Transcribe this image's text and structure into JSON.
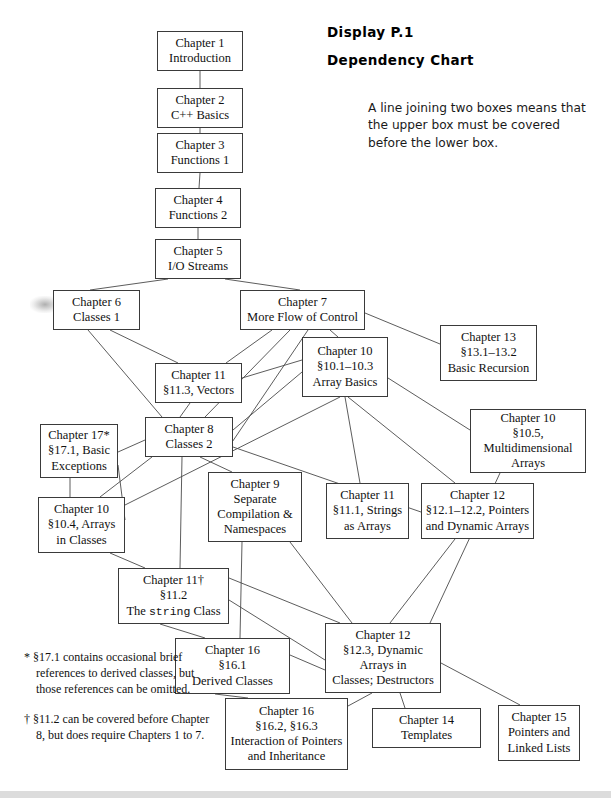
{
  "header": {
    "title_line_1": "Display P.1",
    "title_line_2": "Dependency Chart",
    "legend_note": "A line joining two boxes means that the upper box must be covered before the lower box."
  },
  "footnotes": {
    "star": "* §17.1 contains occasional brief references to derived classes, but those references can be omitted.",
    "dagger": "† §11.2 can be covered before Chapter 8, but does require Chapters 1 to 7."
  },
  "chart_data": {
    "type": "diagram",
    "title": "Display P.1 Dependency Chart",
    "nodes": [
      {
        "id": "ch1",
        "lines": [
          "Chapter 1",
          "Introduction"
        ],
        "x": 157,
        "y": 31,
        "w": 86,
        "h": 40
      },
      {
        "id": "ch2",
        "lines": [
          "Chapter 2",
          "C++ Basics"
        ],
        "x": 157,
        "y": 88,
        "w": 86,
        "h": 40
      },
      {
        "id": "ch3",
        "lines": [
          "Chapter 3",
          "Functions 1"
        ],
        "x": 157,
        "y": 133,
        "w": 86,
        "h": 40
      },
      {
        "id": "ch4",
        "lines": [
          "Chapter 4",
          "Functions 2"
        ],
        "x": 155,
        "y": 188,
        "w": 86,
        "h": 40
      },
      {
        "id": "ch5",
        "lines": [
          "Chapter 5",
          "I/O Streams"
        ],
        "x": 155,
        "y": 239,
        "w": 86,
        "h": 40
      },
      {
        "id": "ch6",
        "lines": [
          "Chapter 6",
          "Classes 1"
        ],
        "x": 53,
        "y": 290,
        "w": 87,
        "h": 40
      },
      {
        "id": "ch7",
        "lines": [
          "Chapter 7",
          "More Flow of Control"
        ],
        "x": 240,
        "y": 290,
        "w": 125,
        "h": 40
      },
      {
        "id": "ch13",
        "lines": [
          "Chapter 13",
          "§13.1–13.2",
          "Basic Recursion"
        ],
        "x": 440,
        "y": 325,
        "w": 97,
        "h": 56
      },
      {
        "id": "ch10a",
        "lines": [
          "Chapter 10",
          "§10.1–10.3",
          "Array Basics"
        ],
        "x": 302,
        "y": 337,
        "w": 86,
        "h": 60
      },
      {
        "id": "ch11v",
        "lines": [
          "Chapter 11",
          "§11.3, Vectors"
        ],
        "x": 155,
        "y": 363,
        "w": 87,
        "h": 40
      },
      {
        "id": "ch10m",
        "lines": [
          "Chapter 10",
          "§10.5,",
          "Multidimensional",
          "Arrays"
        ],
        "x": 470,
        "y": 409,
        "w": 116,
        "h": 64
      },
      {
        "id": "ch8",
        "lines": [
          "Chapter 8",
          "Classes 2"
        ],
        "x": 145,
        "y": 417,
        "w": 88,
        "h": 40
      },
      {
        "id": "ch17",
        "lines": [
          "Chapter 17*",
          "§17.1, Basic",
          "Exceptions"
        ],
        "x": 40,
        "y": 424,
        "w": 78,
        "h": 54
      },
      {
        "id": "ch9",
        "lines": [
          "Chapter 9",
          "Separate",
          "Compilation &",
          "Namespaces"
        ],
        "x": 208,
        "y": 472,
        "w": 94,
        "h": 70
      },
      {
        "id": "ch10c",
        "lines": [
          "Chapter 10",
          "§10.4, Arrays",
          "in Classes"
        ],
        "x": 38,
        "y": 497,
        "w": 87,
        "h": 56
      },
      {
        "id": "ch11s",
        "lines": [
          "Chapter 11",
          "§11.1, Strings",
          "as Arrays"
        ],
        "x": 326,
        "y": 483,
        "w": 83,
        "h": 56
      },
      {
        "id": "ch12p",
        "lines": [
          "Chapter 12",
          "§12.1–12.2, Pointers",
          "and Dynamic Arrays"
        ],
        "x": 421,
        "y": 483,
        "w": 113,
        "h": 56
      },
      {
        "id": "ch11str",
        "lines": [
          "Chapter 11†",
          "§11.2",
          "The string Class"
        ],
        "x": 118,
        "y": 568,
        "w": 111,
        "h": 56
      },
      {
        "id": "ch16d",
        "lines": [
          "Chapter 16",
          "§16.1",
          "Derived Classes"
        ],
        "x": 175,
        "y": 638,
        "w": 115,
        "h": 56
      },
      {
        "id": "ch12d",
        "lines": [
          "Chapter 12",
          "§12.3, Dynamic",
          "Arrays in",
          "Classes; Destructors"
        ],
        "x": 325,
        "y": 623,
        "w": 116,
        "h": 70
      },
      {
        "id": "ch16i",
        "lines": [
          "Chapter 16",
          "§16.2, §16.3",
          "Interaction of Pointers",
          "and Inheritance"
        ],
        "x": 225,
        "y": 698,
        "w": 123,
        "h": 72
      },
      {
        "id": "ch14",
        "lines": [
          "Chapter 14",
          "Templates"
        ],
        "x": 372,
        "y": 708,
        "w": 109,
        "h": 40
      },
      {
        "id": "ch15",
        "lines": [
          "Chapter 15",
          "Pointers and",
          "Linked Lists"
        ],
        "x": 498,
        "y": 705,
        "w": 82,
        "h": 56
      }
    ],
    "edges": [
      [
        "ch1",
        "ch2"
      ],
      [
        "ch2",
        "ch3"
      ],
      [
        "ch3",
        "ch4"
      ],
      [
        "ch4",
        "ch5"
      ],
      [
        "ch5",
        "ch6"
      ],
      [
        "ch5",
        "ch7"
      ],
      [
        "ch6",
        "ch11v"
      ],
      [
        "ch6",
        "ch8"
      ],
      [
        "ch7",
        "ch11v"
      ],
      [
        "ch7",
        "ch10a"
      ],
      [
        "ch7",
        "ch13"
      ],
      [
        "ch7",
        "ch8"
      ],
      [
        "ch11v",
        "ch8"
      ],
      [
        "ch11v",
        "ch10a"
      ],
      [
        "ch10a",
        "ch10m"
      ],
      [
        "ch10a",
        "ch11s"
      ],
      [
        "ch10a",
        "ch12p"
      ],
      [
        "ch10a",
        "ch10c"
      ],
      [
        "ch8",
        "ch17"
      ],
      [
        "ch8",
        "ch10c"
      ],
      [
        "ch8",
        "ch9"
      ],
      [
        "ch8",
        "ch11str"
      ],
      [
        "ch8",
        "ch12p"
      ],
      [
        "ch17",
        "ch10c"
      ],
      [
        "ch10c",
        "ch11str"
      ],
      [
        "ch9",
        "ch16d"
      ],
      [
        "ch9",
        "ch12d"
      ],
      [
        "ch11str",
        "ch16d"
      ],
      [
        "ch11str",
        "ch12d"
      ],
      [
        "ch12p",
        "ch12d"
      ],
      [
        "ch16d",
        "ch16i"
      ],
      [
        "ch16d",
        "ch12d"
      ],
      [
        "ch12d",
        "ch14"
      ],
      [
        "ch12d",
        "ch15"
      ],
      [
        "ch12d",
        "ch16i"
      ],
      [
        "ch10m",
        "ch12d"
      ]
    ]
  }
}
